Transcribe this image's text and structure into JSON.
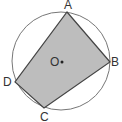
{
  "diagram": {
    "type": "inscribed-quadrilateral",
    "circle": {
      "cx": 61,
      "cy": 61,
      "r": 49,
      "stroke": "#777777"
    },
    "polygon": {
      "fill": "#bdbdbd",
      "stroke": "#444444"
    },
    "points": {
      "A": {
        "x": 67,
        "y": 12,
        "label": "A"
      },
      "B": {
        "x": 110,
        "y": 62,
        "label": "B"
      },
      "C": {
        "x": 44,
        "y": 108,
        "label": "C"
      },
      "D": {
        "x": 15,
        "y": 82,
        "label": "D"
      }
    },
    "center": {
      "x": 61,
      "y": 62,
      "label": "O"
    }
  }
}
